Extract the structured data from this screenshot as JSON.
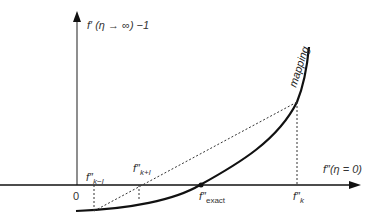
{
  "diagram": {
    "y_axis_label": "f′ (η → ∞) −1",
    "x_axis_label": "f″(η = 0)",
    "origin_label": "0",
    "curve_label": "mapping",
    "points": [
      {
        "id": "k-1",
        "prime": "f″",
        "sub": "k−l"
      },
      {
        "id": "k+1",
        "prime": "f″",
        "sub": "k+l"
      },
      {
        "id": "exact",
        "prime": "f″",
        "sub": "exact"
      },
      {
        "id": "k",
        "prime": "f″",
        "sub": "k"
      }
    ],
    "colors": {
      "axis": "#111111",
      "curve": "#111111",
      "dotted": "#333333"
    }
  }
}
